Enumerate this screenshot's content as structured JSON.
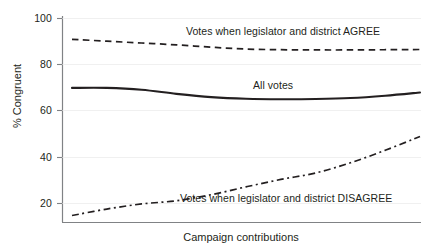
{
  "chart_data": {
    "type": "line",
    "title": "",
    "subtitle": "",
    "xlabel": "Campaign contributions",
    "ylabel": "% Congruent",
    "xlim": [
      0,
      100
    ],
    "ylim": [
      13,
      103
    ],
    "grid": false,
    "legend_position": "inline-annotations",
    "x_tick_labels": [],
    "y_ticks": [
      20,
      40,
      60,
      80,
      100
    ],
    "y_tick_labels": [
      "20",
      "40",
      "60",
      "80",
      "100"
    ],
    "x": [
      0,
      10,
      20,
      30,
      40,
      50,
      60,
      70,
      80,
      90,
      100
    ],
    "series": [
      {
        "name": "Votes when legislator and district AGREE",
        "style": "dashed",
        "color": "#231f20",
        "values": [
          91.0,
          90.2,
          89.4,
          88.6,
          87.6,
          86.8,
          86.5,
          86.4,
          86.4,
          86.5,
          86.6
        ],
        "annotation": "Votes when legislator and district AGREE",
        "annotation_x": 57,
        "annotation_y": 94
      },
      {
        "name": "All votes",
        "style": "solid",
        "color": "#231f20",
        "values": [
          70.0,
          70.0,
          69.2,
          67.4,
          66.0,
          65.3,
          65.1,
          65.2,
          65.6,
          66.6,
          68.0
        ],
        "annotation": "All votes",
        "annotation_x": 61,
        "annotation_y": 75
      },
      {
        "name": "Votes when legislator and district DISAGREE",
        "style": "dash-dot",
        "color": "#231f20",
        "values": [
          14.8,
          17.6,
          19.8,
          21.2,
          23.8,
          27.2,
          30.4,
          33.2,
          37.6,
          43.0,
          49.0
        ],
        "annotation": "Votes when legislator and district DISAGREE",
        "annotation_x": 54,
        "annotation_y": 22
      }
    ]
  },
  "axes": {
    "y_tick_labels": [
      "100",
      "80",
      "60",
      "40",
      "20"
    ],
    "y_axis_title": "% Congruent",
    "x_axis_title": "Campaign contributions"
  },
  "annotations": {
    "agree": "Votes when legislator and district AGREE",
    "all_votes": "All votes",
    "disagree": "Votes when legislator and district DISAGREE"
  },
  "colors": {
    "line": "#231f20",
    "axis": "#808285",
    "text": "#231f20",
    "background": "#ffffff"
  }
}
